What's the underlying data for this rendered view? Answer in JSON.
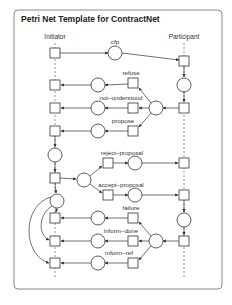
{
  "diagram": {
    "title": "Petri Net Template for ContractNet",
    "roles": {
      "initiator": "Initiator",
      "participant": "Participant"
    },
    "messages": {
      "cfp": "cfp",
      "refuse": "refuse",
      "not_understood": "not–understood",
      "propose": "propose",
      "reject_proposal": "reject–proposal",
      "accept_proposal": "accept–proposal",
      "failure": "failure",
      "inform_done": "inform–done",
      "inform_ref": "inform–ref"
    },
    "colors": {
      "stroke": "#333333",
      "frame": "#8a8a8a",
      "lifeline": "#777777"
    }
  }
}
